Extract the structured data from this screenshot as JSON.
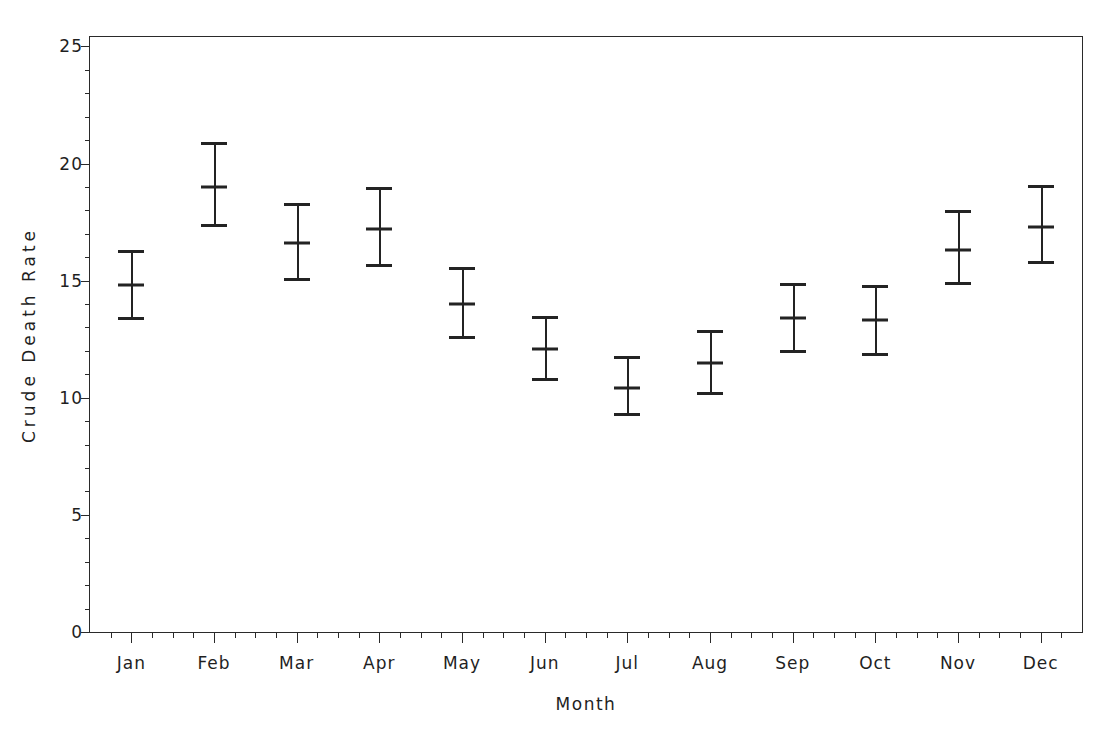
{
  "chart_data": {
    "type": "scatter",
    "title": "",
    "xlabel": "Month",
    "ylabel": "Crude Death Rate",
    "categories": [
      "Jan",
      "Feb",
      "Mar",
      "Apr",
      "May",
      "Jun",
      "Jul",
      "Aug",
      "Sep",
      "Oct",
      "Nov",
      "Dec"
    ],
    "values": [
      14.8,
      19.0,
      16.6,
      17.2,
      14.0,
      12.1,
      10.4,
      11.5,
      13.4,
      13.3,
      16.3,
      17.3
    ],
    "error_low": [
      13.3,
      17.3,
      15.0,
      15.6,
      12.5,
      10.7,
      9.2,
      10.1,
      11.9,
      11.8,
      14.8,
      15.7
    ],
    "error_high": [
      16.3,
      20.9,
      18.3,
      19.0,
      15.6,
      13.5,
      11.8,
      12.9,
      14.9,
      14.8,
      18.0,
      19.1
    ],
    "ylim": [
      0,
      25.4
    ],
    "ytick_labels": [
      "0",
      "5",
      "10",
      "15",
      "20",
      "25"
    ],
    "ytick_values": [
      0,
      5,
      10,
      15,
      20,
      25
    ],
    "yminor_step": 1,
    "xminor_per_major": 4,
    "grid": false,
    "legend": "none",
    "marker": "mean-with-error-bars",
    "series_color": "#232323"
  },
  "axes": {
    "frame_color": "#2a2a2a"
  }
}
